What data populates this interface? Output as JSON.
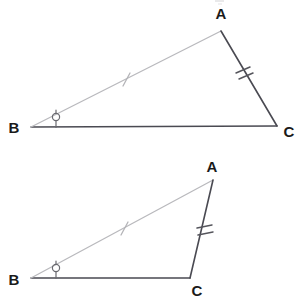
{
  "figure": {
    "width": 302,
    "height": 308,
    "background_color": "#ffffff",
    "colors": {
      "dark_stroke": "#4a4a52",
      "light_stroke": "#b9b9bd",
      "label_fill": "#1a1a1a",
      "angle_mark": "#6a6a70"
    }
  },
  "diagrams": [
    {
      "id": "triangle-upper",
      "name": "upper-triangle",
      "vertices": [
        {
          "label": "A",
          "x": 221,
          "y": 31,
          "label_x": 221,
          "label_y": 19
        },
        {
          "label": "B",
          "x": 31,
          "y": 127,
          "label_x": 16,
          "label_y": 133
        },
        {
          "label": "C",
          "x": 277,
          "y": 126,
          "label_x": 287,
          "label_y": 136
        }
      ],
      "sides": [
        {
          "name": "BA",
          "from": "B",
          "to": "A",
          "shade": "light",
          "ticks": 1
        },
        {
          "name": "AC",
          "from": "A",
          "to": "C",
          "shade": "dark",
          "ticks": 2
        },
        {
          "name": "BC",
          "from": "B",
          "to": "C",
          "shade": "dark",
          "ticks": 0
        }
      ],
      "angle_marks": [
        {
          "at": "B",
          "style": "circle-with-stem",
          "x": 56,
          "y": 117
        }
      ]
    },
    {
      "id": "triangle-lower",
      "name": "lower-triangle",
      "vertices": [
        {
          "label": "A",
          "x": 213,
          "y": 180,
          "label_x": 210,
          "label_y": 172
        },
        {
          "label": "B",
          "x": 31,
          "y": 278,
          "label_x": 16,
          "label_y": 285
        },
        {
          "label": "C",
          "x": 190,
          "y": 278,
          "label_x": 195,
          "label_y": 295
        }
      ],
      "sides": [
        {
          "name": "BA",
          "from": "B",
          "to": "A",
          "shade": "light",
          "ticks": 1
        },
        {
          "name": "AC",
          "from": "A",
          "to": "C",
          "shade": "dark",
          "ticks": 2
        },
        {
          "name": "BC",
          "from": "B",
          "to": "C",
          "shade": "dark",
          "ticks": 0
        }
      ],
      "angle_marks": [
        {
          "at": "B",
          "style": "circle-with-stem",
          "x": 56,
          "y": 268
        }
      ]
    }
  ],
  "labels": {
    "upper_a": "A",
    "upper_b": "B",
    "upper_c": "C",
    "lower_a": "A",
    "lower_b": "B",
    "lower_c": "C"
  }
}
